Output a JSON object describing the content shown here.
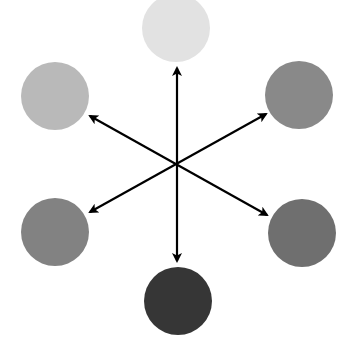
{
  "diagram": {
    "title": "",
    "arrow_color": "#000000",
    "nodes": [
      {
        "id": "top",
        "position": "top",
        "color": "#e2e2e2"
      },
      {
        "id": "upper-left",
        "position": "upper-left",
        "color": "#b9b9b9"
      },
      {
        "id": "upper-right",
        "position": "upper-right",
        "color": "#898989"
      },
      {
        "id": "lower-left",
        "position": "lower-left",
        "color": "#828282"
      },
      {
        "id": "lower-right",
        "position": "lower-right",
        "color": "#6f6f6f"
      },
      {
        "id": "bottom",
        "position": "bottom",
        "color": "#363636"
      }
    ],
    "arrows": [
      {
        "from": "top",
        "to": "bottom",
        "double_headed": true
      },
      {
        "from": "upper-left",
        "to": "lower-right",
        "double_headed": true
      },
      {
        "from": "upper-right",
        "to": "lower-left",
        "double_headed": true
      }
    ]
  }
}
